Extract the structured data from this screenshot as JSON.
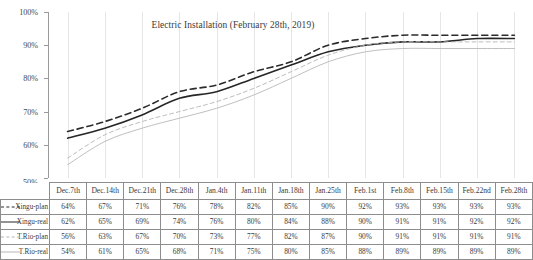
{
  "chart_data": {
    "type": "line",
    "title": "Electric Installation (February 28th, 2019)",
    "xlabel": "",
    "ylabel": "",
    "ylim": [
      50,
      100
    ],
    "ytick_labels": [
      "100%",
      "90%",
      "80%",
      "70%",
      "60%",
      "50%"
    ],
    "ytick_values": [
      100,
      90,
      80,
      70,
      60,
      50
    ],
    "grid": "vertical",
    "legend_position": "table-row-labels",
    "categories": [
      "Dec.7th",
      "Dec.14th",
      "Dec.21th",
      "Dec.28th",
      "Jan.4th",
      "Jan.11th",
      "Jan.18th",
      "Jan.25th",
      "Feb.1st",
      "Feb.8th",
      "Feb.15th",
      "Feb.22nd",
      "Feb.28th"
    ],
    "series": [
      {
        "name": "Xingu-plan",
        "style": "dashed",
        "color": "#2b2b2b",
        "values": [
          64,
          67,
          71,
          76,
          78,
          82,
          85,
          90,
          92,
          93,
          93,
          93,
          93
        ],
        "labels": [
          "64%",
          "67%",
          "71%",
          "76%",
          "78%",
          "82%",
          "85%",
          "90%",
          "92%",
          "93%",
          "93%",
          "93%",
          "93%"
        ]
      },
      {
        "name": "Xingu-real",
        "style": "solid",
        "color": "#262626",
        "values": [
          62,
          65,
          69,
          74,
          76,
          80,
          84,
          88,
          90,
          91,
          91,
          92,
          92
        ],
        "labels": [
          "62%",
          "65%",
          "69%",
          "74%",
          "76%",
          "80%",
          "84%",
          "88%",
          "90%",
          "91%",
          "91%",
          "92%",
          "92%"
        ]
      },
      {
        "name": "T.Rio-plan",
        "style": "dashed",
        "color": "#b4b4b4",
        "values": [
          56,
          63,
          67,
          70,
          73,
          77,
          82,
          87,
          90,
          91,
          91,
          91,
          91
        ],
        "labels": [
          "56%",
          "63%",
          "67%",
          "70%",
          "73%",
          "77%",
          "82%",
          "87%",
          "90%",
          "91%",
          "91%",
          "91%",
          "91%"
        ]
      },
      {
        "name": "T.Rio-real",
        "style": "solid",
        "color": "#b8b8b8",
        "values": [
          54,
          61,
          65,
          68,
          71,
          75,
          80,
          85,
          88,
          89,
          89,
          89,
          89
        ],
        "labels": [
          "54%",
          "61%",
          "65%",
          "68%",
          "71%",
          "75%",
          "80%",
          "85%",
          "88%",
          "89%",
          "89%",
          "89%",
          "89%"
        ]
      }
    ]
  },
  "table": {
    "corner_label": "50%",
    "headers": [
      "Dec.7th",
      "Dec.14th",
      "Dec.21th",
      "Dec.28th",
      "Jan.4th",
      "Jan.11th",
      "Jan.18th",
      "Jan.25th",
      "Feb.1st",
      "Feb.8th",
      "Feb.15th",
      "Feb.22nd",
      "Feb.28th"
    ],
    "rows": [
      {
        "label": "Xingu-plan",
        "swatch": "dark-dashed-line-icon",
        "cells": [
          "64%",
          "67%",
          "71%",
          "76%",
          "78%",
          "82%",
          "85%",
          "90%",
          "92%",
          "93%",
          "93%",
          "93%",
          "93%"
        ]
      },
      {
        "label": "Xingu-real",
        "swatch": "dark-solid-line-icon",
        "cells": [
          "62%",
          "65%",
          "69%",
          "74%",
          "76%",
          "80%",
          "84%",
          "88%",
          "90%",
          "91%",
          "91%",
          "92%",
          "92%"
        ]
      },
      {
        "label": "T.Rio-plan",
        "swatch": "light-dashed-line-icon",
        "cells": [
          "56%",
          "63%",
          "67%",
          "70%",
          "73%",
          "77%",
          "82%",
          "87%",
          "90%",
          "91%",
          "91%",
          "91%",
          "91%"
        ]
      },
      {
        "label": "T.Rio-real",
        "swatch": "light-solid-line-icon",
        "cells": [
          "54%",
          "61%",
          "65%",
          "68%",
          "71%",
          "75%",
          "80%",
          "85%",
          "88%",
          "89%",
          "89%",
          "89%",
          "89%"
        ]
      }
    ]
  }
}
